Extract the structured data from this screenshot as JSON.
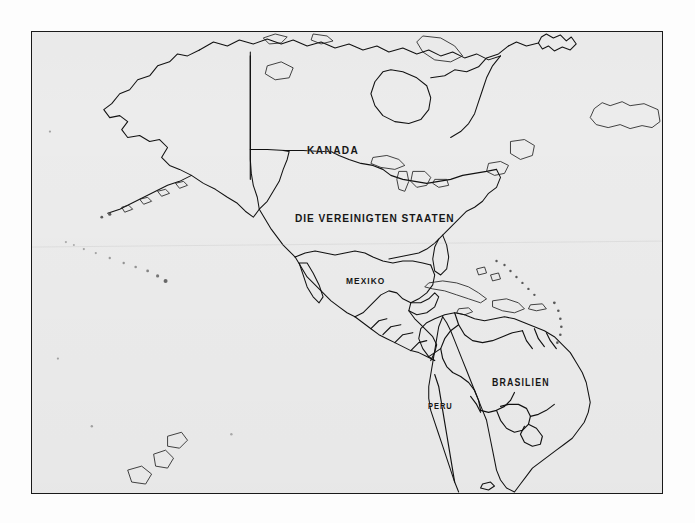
{
  "figure": {
    "kind": "outline-map",
    "region": "Americas",
    "language": "German",
    "frame": {
      "visible": true,
      "color": "#1a1a1a"
    },
    "colors": {
      "page_background": "#fdfdfd",
      "map_background": "#ececec",
      "coastline": "#111111",
      "border": "#111111",
      "label_text": "#161616"
    }
  },
  "labels": {
    "kanada": "KANADA",
    "usa": "DIE VEREINIGTEN STAATEN",
    "mexiko": "MEXIKO",
    "brasilien": "BRASILIEN",
    "peru": "PERU",
    "argentinien": "ARGENTINIEN"
  },
  "label_list": [
    {
      "name": "kanada",
      "text": "KANADA"
    },
    {
      "name": "usa",
      "text": "DIE VEREINIGTEN STAATEN"
    },
    {
      "name": "mexiko",
      "text": "MEXIKO"
    },
    {
      "name": "brasilien",
      "text": "BRASILIEN"
    },
    {
      "name": "peru",
      "text": "PERU"
    },
    {
      "name": "argentinien",
      "text": "ARGENTINIEN"
    }
  ]
}
